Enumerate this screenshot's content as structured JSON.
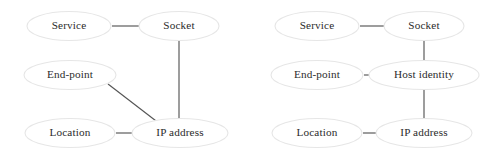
{
  "figure": {
    "background_color": "#ffffff",
    "node_fill_color": "#ffffff",
    "node_stroke_color": "#e6e6e6",
    "edge_color": "#555555",
    "label_color": "#2b2b2b"
  },
  "diagrams": [
    {
      "id": "left-diagram",
      "name": "without-host-identity",
      "nodes": [
        {
          "id": "l-service",
          "label": "Service",
          "cx": 69,
          "cy": 26,
          "rx": 42,
          "ry": 14.5
        },
        {
          "id": "l-socket",
          "label": "Socket",
          "cx": 179,
          "cy": 26,
          "rx": 40,
          "ry": 14.5
        },
        {
          "id": "l-endpoint",
          "label": "End-point",
          "cx": 70,
          "cy": 75,
          "rx": 46,
          "ry": 14.5
        },
        {
          "id": "l-location",
          "label": "Location",
          "cx": 70,
          "cy": 133,
          "rx": 45,
          "ry": 14.5
        },
        {
          "id": "l-ipaddress",
          "label": "IP address",
          "cx": 180,
          "cy": 133,
          "rx": 48,
          "ry": 14.5
        }
      ],
      "edges": [
        {
          "id": "l-e1",
          "from": "Service",
          "to": "Socket",
          "kind": "horizontal",
          "x1": 112,
          "y1": 26,
          "x2": 139,
          "y2": 26
        },
        {
          "id": "l-e2",
          "from": "Socket",
          "to": "IP address",
          "kind": "vertical",
          "x1": 179,
          "y1": 41,
          "x2": 179,
          "y2": 120
        },
        {
          "id": "l-e3",
          "from": "End-point",
          "to": "IP address",
          "kind": "diagonal",
          "x1": 108,
          "y1": 84,
          "x2": 160,
          "y2": 124
        },
        {
          "id": "l-e4",
          "from": "Location",
          "to": "IP address",
          "kind": "horizontal",
          "x1": 116,
          "y1": 133,
          "x2": 141,
          "y2": 133
        }
      ]
    },
    {
      "id": "right-diagram",
      "name": "with-host-identity",
      "nodes": [
        {
          "id": "r-service",
          "label": "Service",
          "cx": 317,
          "cy": 26,
          "rx": 42,
          "ry": 14.5
        },
        {
          "id": "r-socket",
          "label": "Socket",
          "cx": 424,
          "cy": 26,
          "rx": 40,
          "ry": 14.5
        },
        {
          "id": "r-endpoint",
          "label": "End-point",
          "cx": 317,
          "cy": 75,
          "rx": 46,
          "ry": 14.5
        },
        {
          "id": "r-hostid",
          "label": "Host identity",
          "cx": 424,
          "cy": 75,
          "rx": 55,
          "ry": 14.5
        },
        {
          "id": "r-location",
          "label": "Location",
          "cx": 317,
          "cy": 133,
          "rx": 45,
          "ry": 14.5
        },
        {
          "id": "r-ipaddress",
          "label": "IP address",
          "cx": 424,
          "cy": 133,
          "rx": 48,
          "ry": 14.5
        }
      ],
      "edges": [
        {
          "id": "r-e1",
          "from": "Service",
          "to": "Socket",
          "kind": "horizontal",
          "x1": 360,
          "y1": 26,
          "x2": 384,
          "y2": 26
        },
        {
          "id": "r-e2",
          "from": "Socket",
          "to": "Host identity",
          "kind": "vertical",
          "x1": 424,
          "y1": 41,
          "x2": 424,
          "y2": 61
        },
        {
          "id": "r-e3",
          "from": "End-point",
          "to": "Host identity",
          "kind": "horizontal",
          "x1": 364,
          "y1": 75,
          "x2": 387,
          "y2": 75
        },
        {
          "id": "r-e4",
          "from": "Host identity",
          "to": "IP address",
          "kind": "vertical",
          "x1": 424,
          "y1": 90,
          "x2": 424,
          "y2": 119
        },
        {
          "id": "r-e5",
          "from": "Location",
          "to": "IP address",
          "kind": "horizontal",
          "x1": 363,
          "y1": 133,
          "x2": 386,
          "y2": 133
        }
      ]
    }
  ]
}
